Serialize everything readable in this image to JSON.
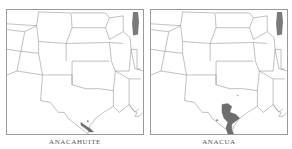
{
  "maps": [
    {
      "id": "anacahuite",
      "caption": "ANACAHUITE",
      "region": "South-central United States (Texas and neighbors)",
      "range_description": "Small shaded range at southern tip of Texas (lower Rio Grande Valley)"
    },
    {
      "id": "anacua",
      "caption": "ANACUA",
      "region": "South-central United States (Texas and neighbors)",
      "range_description": "Larger shaded range across south Texas, from south-central Texas to lower Rio Grande"
    }
  ],
  "colors": {
    "background": "#ffffff",
    "state_lines": "#8c8c8c",
    "range_fill": "#6e6e6e",
    "frame": "#9a9a9a",
    "caption": "#555555"
  }
}
